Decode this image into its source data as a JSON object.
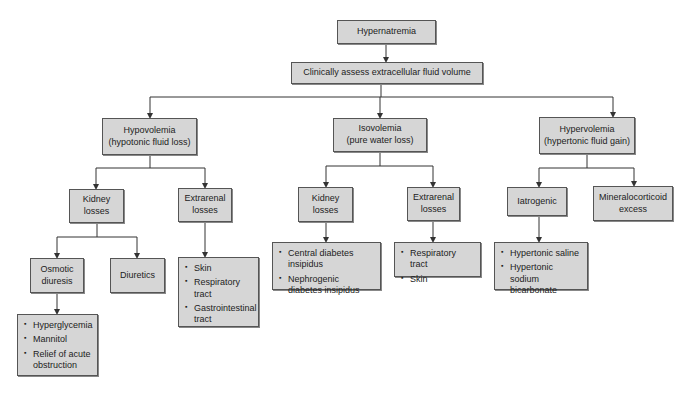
{
  "diagram": {
    "root": {
      "label": "Hypernatremia"
    },
    "assess": {
      "label": "Clinically assess extracellular fluid volume"
    },
    "branches": [
      {
        "title": "Hypovolemia",
        "subtitle": "(hypotonic fluid loss)",
        "children": [
          {
            "line1": "Kidney",
            "line2": "losses",
            "children": [
              {
                "line1": "Osmotic",
                "line2": "diuresis",
                "items": [
                  "Hyperglycemia",
                  "Mannitol",
                  "Relief of acute obstruction"
                ]
              },
              {
                "label": "Diuretics"
              }
            ]
          },
          {
            "line1": "Extrarenal",
            "line2": "losses",
            "items": [
              "Skin",
              "Respiratory tract",
              "Gastrointestinal tract"
            ]
          }
        ]
      },
      {
        "title": "Isovolemia",
        "subtitle": "(pure water loss)",
        "children": [
          {
            "line1": "Kidney",
            "line2": "losses",
            "items": [
              "Central diabetes insipidus",
              "Nephrogenic diabetes insipidus"
            ]
          },
          {
            "line1": "Extrarenal",
            "line2": "losses",
            "items": [
              "Respiratory tract",
              "Skin"
            ]
          }
        ]
      },
      {
        "title": "Hypervolemia",
        "subtitle": "(hypertonic fluid gain)",
        "children": [
          {
            "label": "Iatrogenic",
            "items": [
              "Hypertonic saline",
              "Hypertonic sodium bicarbonate"
            ]
          },
          {
            "line1": "Mineralocorticoid",
            "line2": "excess"
          }
        ]
      }
    ]
  },
  "colors": {
    "box_fill": "#d6d6d6",
    "box_border": "#555555",
    "line": "#333333"
  }
}
